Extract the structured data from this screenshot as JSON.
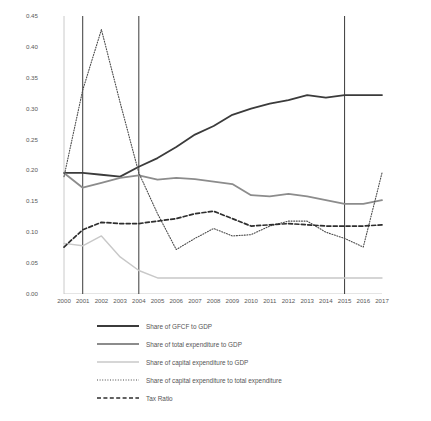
{
  "chart_data": {
    "type": "line",
    "title": "",
    "xlabel": "",
    "ylabel": "",
    "ylim": [
      0.0,
      0.45
    ],
    "ytick_labels": [
      "0.00",
      "0.05",
      "0.10",
      "0.15",
      "0.20",
      "0.25",
      "0.30",
      "0.35",
      "0.40",
      "0.45"
    ],
    "ytick_values": [
      0.0,
      0.05,
      0.1,
      0.15,
      0.2,
      0.25,
      0.3,
      0.35,
      0.4,
      0.45
    ],
    "grid": false,
    "legend_position": "below",
    "categories": [
      "2000",
      "2001",
      "2002",
      "2003",
      "2004",
      "2005",
      "2006",
      "2007",
      "2008",
      "2009",
      "2010",
      "2011",
      "2012",
      "2013",
      "2014",
      "2015",
      "2016",
      "2017"
    ],
    "vertical_markers": [
      2001,
      2004,
      2015
    ],
    "series": [
      {
        "name": "Share of GFCF to GDP",
        "style": "solid-dark",
        "color": "#3b3b3b",
        "values": [
          0.196,
          0.196,
          0.193,
          0.19,
          0.206,
          0.22,
          0.238,
          0.258,
          0.272,
          0.29,
          0.3,
          0.308,
          0.314,
          0.322,
          0.318,
          0.322,
          0.322,
          0.322
        ]
      },
      {
        "name": "Share of total expenditure to GDP",
        "style": "solid-gray",
        "color": "#8c8c8c",
        "values": [
          0.196,
          0.172,
          0.18,
          0.188,
          0.192,
          0.185,
          0.188,
          0.186,
          0.182,
          0.178,
          0.16,
          0.158,
          0.162,
          0.158,
          0.152,
          0.146,
          0.146,
          0.152
        ]
      },
      {
        "name": "Share of capital expenditure to GDP",
        "style": "solid-light",
        "color": "#c8c8c8",
        "values": [
          0.082,
          0.078,
          0.094,
          0.06,
          0.038,
          0.026,
          0.026,
          0.026,
          0.026,
          0.026,
          0.026,
          0.026,
          0.026,
          0.026,
          0.026,
          0.026,
          0.026,
          0.026
        ]
      },
      {
        "name": "Share of capital expenditure to total expenditure",
        "style": "dotted",
        "color": "#4a4a4a",
        "values": [
          0.19,
          0.33,
          0.428,
          0.31,
          0.196,
          0.13,
          0.072,
          0.09,
          0.106,
          0.094,
          0.096,
          0.11,
          0.118,
          0.118,
          0.1,
          0.09,
          0.076,
          0.196
        ]
      },
      {
        "name": "Tax Ratio",
        "style": "dashed",
        "color": "#2e2e2e",
        "values": [
          0.076,
          0.104,
          0.116,
          0.114,
          0.114,
          0.118,
          0.122,
          0.13,
          0.134,
          0.122,
          0.11,
          0.112,
          0.114,
          0.112,
          0.11,
          0.11,
          0.11,
          0.112
        ]
      }
    ]
  }
}
